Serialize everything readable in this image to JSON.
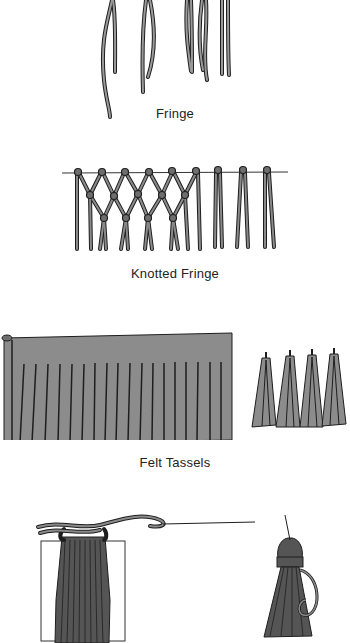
{
  "figures": [
    {
      "id": "fringe",
      "caption": "Fringe"
    },
    {
      "id": "knotted-fringe",
      "caption": "Knotted Fringe"
    },
    {
      "id": "felt-tassels",
      "caption": "Felt Tassels"
    },
    {
      "id": "yarn-tassel",
      "caption": ""
    }
  ],
  "colors": {
    "cord": "#6e6e6e",
    "outline": "#1e1e1e",
    "felt": "#8c8c8c",
    "background": "#ffffff"
  }
}
